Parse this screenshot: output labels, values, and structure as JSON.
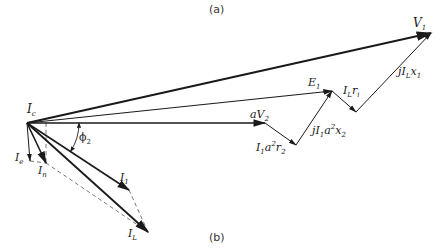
{
  "figure": {
    "panel_a_label": "(a)",
    "panel_b_label": "(b)",
    "origin": [
      27,
      123
    ],
    "colors": {
      "ink": "#1a1a1a",
      "dashed": "#555555",
      "background": "#ffffff"
    }
  },
  "phasors": [
    {
      "id": "V1",
      "label": "V",
      "sub": "1",
      "from": [
        27,
        123
      ],
      "to": [
        431,
        33
      ],
      "weight": 2.0,
      "style": "solid"
    },
    {
      "id": "E1",
      "label": "E",
      "sub": "1",
      "from": [
        27,
        123
      ],
      "to": [
        332,
        91
      ],
      "weight": 1.2,
      "style": "solid"
    },
    {
      "id": "aV2",
      "label": "aV",
      "sub": "2",
      "from": [
        27,
        123
      ],
      "to": [
        265,
        123
      ],
      "weight": 1.6,
      "style": "solid"
    },
    {
      "id": "I1a2r2",
      "label": "I₁a²r₂",
      "from": [
        265,
        123
      ],
      "to": [
        296,
        145
      ],
      "weight": 1.0,
      "style": "solid"
    },
    {
      "id": "jI1a2x2",
      "label": "jI₁a²x₂",
      "from": [
        296,
        145
      ],
      "to": [
        332,
        91
      ],
      "weight": 1.0,
      "style": "solid"
    },
    {
      "id": "ILr1",
      "label": "I_L r₁",
      "from": [
        332,
        91
      ],
      "to": [
        356,
        112
      ],
      "weight": 1.0,
      "style": "solid"
    },
    {
      "id": "jILx1",
      "label": "jI_L x₁",
      "from": [
        356,
        112
      ],
      "to": [
        431,
        33
      ],
      "weight": 1.0,
      "style": "solid"
    },
    {
      "id": "Ie",
      "label": "I",
      "sub": "e",
      "from": [
        27,
        123
      ],
      "to": [
        30,
        161
      ],
      "weight": 1.0,
      "style": "solid"
    },
    {
      "id": "In",
      "label": "I",
      "sub": "n",
      "from": [
        27,
        123
      ],
      "to": [
        46,
        163
      ],
      "weight": 1.6,
      "style": "solid"
    },
    {
      "id": "I1",
      "label": "I",
      "sub": "1",
      "from": [
        27,
        123
      ],
      "to": [
        129,
        190
      ],
      "weight": 1.6,
      "style": "solid"
    },
    {
      "id": "IL",
      "label": "I",
      "sub": "L",
      "from": [
        27,
        123
      ],
      "to": [
        148,
        232
      ],
      "weight": 1.8,
      "style": "solid"
    }
  ],
  "construction_lines": [
    {
      "from": [
        46,
        123
      ],
      "to": [
        46,
        163
      ]
    },
    {
      "from": [
        30,
        161
      ],
      "to": [
        46,
        163
      ]
    },
    {
      "from": [
        46,
        163
      ],
      "to": [
        148,
        232
      ]
    },
    {
      "from": [
        129,
        190
      ],
      "to": [
        148,
        232
      ]
    }
  ],
  "angle": {
    "label": "ϕ",
    "sub": "2",
    "center": [
      27,
      123
    ],
    "radius": 52
  },
  "labels": {
    "V1": {
      "main": "V",
      "sub": "1"
    },
    "E1": {
      "main": "E",
      "sub": "1"
    },
    "aV2": {
      "main": "aV",
      "sub": "2"
    },
    "I1a2r2": {
      "main": "I",
      "sub1": "1",
      "mid": "a",
      "sup": "2",
      "mid2": "r",
      "sub2": "2"
    },
    "jI1a2x2": {
      "main": "jI",
      "sub1": "1",
      "mid": "a",
      "sup": "2",
      "mid2": "x",
      "sub2": "2"
    },
    "ILr1": {
      "main": "I",
      "sub1": "L",
      "mid2": "r",
      "sub2": "i"
    },
    "jILx1": {
      "main": "jI",
      "sub1": "L",
      "mid2": "x",
      "sub2": "1"
    },
    "Ic": {
      "main": "I",
      "sub": "c"
    },
    "Ie": {
      "main": "I",
      "sub": "e"
    },
    "In": {
      "main": "I",
      "sub": "n"
    },
    "I1": {
      "main": "I",
      "sub": "1"
    },
    "IL": {
      "main": "I",
      "sub": "L"
    },
    "phi2": {
      "main": "ϕ",
      "sub": "2"
    }
  }
}
